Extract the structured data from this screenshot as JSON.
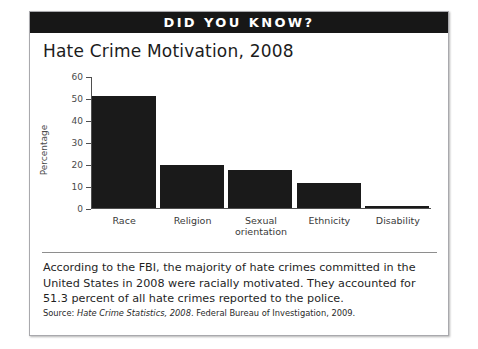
{
  "header": {
    "title": "DID YOU KNOW?"
  },
  "chart_data": {
    "type": "bar",
    "title": "Hate Crime Motivation, 2008",
    "xlabel": "",
    "ylabel": "Percentage",
    "categories": [
      "Race",
      "Religion",
      "Sexual orientation",
      "Ethnicity",
      "Disability"
    ],
    "values": [
      51.3,
      19.5,
      17.6,
      11.5,
      1.0
    ],
    "ylim": [
      0,
      60
    ],
    "yticks": [
      0,
      10,
      20,
      30,
      40,
      50,
      60
    ],
    "ytick_labels": [
      "0",
      "10",
      "20",
      "30",
      "40",
      "50",
      "60"
    ],
    "grid": false,
    "legend": "none",
    "bar_color": "#1a1a1a"
  },
  "caption": {
    "text": "According to the FBI, the majority of hate crimes committed in the United States in 2008 were racially motivated. They accounted for 51.3 percent of all hate crimes reported to the police."
  },
  "source": {
    "prefix": "Source: ",
    "italic_title": "Hate Crime Statistics, 2008",
    "suffix": ". Federal Bureau of Investigation, 2009."
  }
}
